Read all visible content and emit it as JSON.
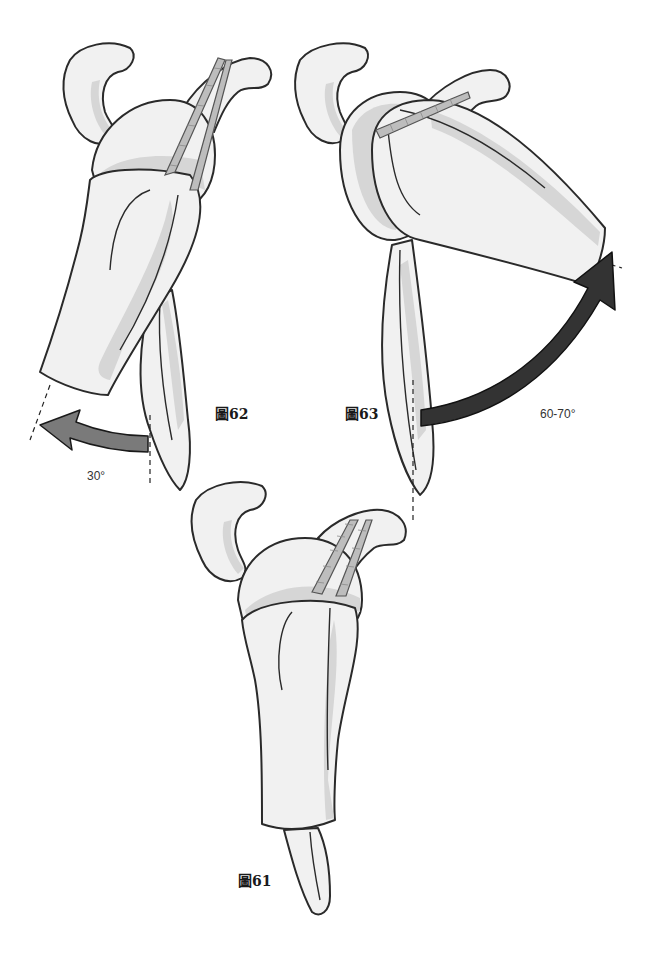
{
  "figures": [
    {
      "id": "fig62",
      "label": "圖62",
      "angle_label": "30°",
      "arrow_color": "#7a7a7a",
      "description": "Humerus abducted 30° (arrow pointing left)"
    },
    {
      "id": "fig63",
      "label": "圖63",
      "angle_label": "60-70°",
      "arrow_color": "#333333",
      "description": "Humerus abducted 60-70° (arrow curving up-right)"
    },
    {
      "id": "fig61",
      "label": "圖61",
      "description": "Neutral position of shoulder joint / humerus"
    }
  ],
  "colors": {
    "background": "#ffffff",
    "bone_fill": "#f1f1f1",
    "bone_shade": "#d6d6d6",
    "outline": "#2a2a2a",
    "arrow_light": "#7a7a7a",
    "arrow_dark": "#333333"
  }
}
